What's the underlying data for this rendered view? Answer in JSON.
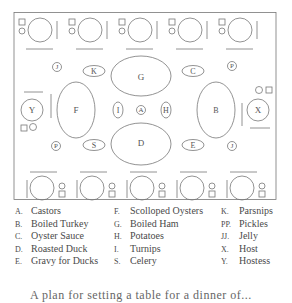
{
  "diagram": {
    "type": "table-setting-plan",
    "dishes": {
      "G": "G",
      "D": "D",
      "F": "F",
      "B": "B",
      "K": "K",
      "C": "C",
      "S": "S",
      "E": "E",
      "I": "I",
      "A": "A",
      "H": "H",
      "J_top": "J",
      "P_top": "P",
      "P_bottom": "P",
      "J_bottom": "J",
      "Y": "Y",
      "X": "X"
    }
  },
  "legend": {
    "col1": [
      {
        "key": "A.",
        "label": "Castors"
      },
      {
        "key": "B.",
        "label": "Boiled Turkey"
      },
      {
        "key": "C.",
        "label": "Oyster Sauce"
      },
      {
        "key": "D.",
        "label": "Roasted Duck"
      },
      {
        "key": "E.",
        "label": "Gravy for Ducks"
      }
    ],
    "col2": [
      {
        "key": "F.",
        "label": "Scolloped Oysters"
      },
      {
        "key": "G.",
        "label": "Boiled Ham"
      },
      {
        "key": "H.",
        "label": "Potatoes"
      },
      {
        "key": "I.",
        "label": "Turnips"
      },
      {
        "key": "S.",
        "label": "Celery"
      }
    ],
    "col3": [
      {
        "key": "K.",
        "label": "Parsnips"
      },
      {
        "key": "PP.",
        "label": "Pickles"
      },
      {
        "key": "JJ.",
        "label": "Jelly"
      },
      {
        "key": "X.",
        "label": "Host"
      },
      {
        "key": "Y.",
        "label": "Hostess"
      }
    ]
  },
  "caption": "A plan for setting a table for a dinner of..."
}
